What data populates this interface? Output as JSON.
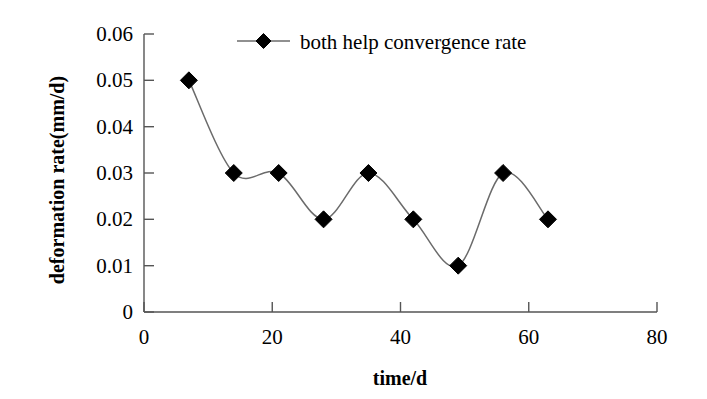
{
  "chart_data": {
    "type": "line",
    "title": "",
    "xlabel": "time/d",
    "ylabel": "deformation rate(mm/d)",
    "xlim": [
      0,
      80
    ],
    "ylim": [
      0,
      0.06
    ],
    "grid": false,
    "legend_position": "top-center",
    "x_ticks": [
      "0",
      "20",
      "40",
      "60",
      "80"
    ],
    "x_tick_values": [
      0,
      20,
      40,
      60,
      80
    ],
    "y_ticks": [
      "0",
      "0.01",
      "0.02",
      "0.03",
      "0.04",
      "0.05",
      "0.06"
    ],
    "y_tick_values": [
      0,
      0.01,
      0.02,
      0.03,
      0.04,
      0.05,
      0.06
    ],
    "series": [
      {
        "name": "both help convergence rate",
        "marker": "diamond",
        "marker_color": "#000000",
        "line_color": "#6b6b6b",
        "x": [
          7,
          14,
          21,
          28,
          35,
          42,
          49,
          56,
          63
        ],
        "values": [
          0.05,
          0.03,
          0.03,
          0.02,
          0.03,
          0.02,
          0.01,
          0.03,
          0.02
        ]
      }
    ]
  },
  "legend": {
    "entries": [
      {
        "label": "both help convergence rate",
        "marker": "diamond-marker-icon"
      }
    ]
  },
  "axes": {
    "x_title": "time/d",
    "y_title": "deformation rate(mm/d)"
  },
  "colors": {
    "marker": "#000000",
    "line": "#6b6b6b",
    "axis": "#555555",
    "background": "#ffffff"
  }
}
